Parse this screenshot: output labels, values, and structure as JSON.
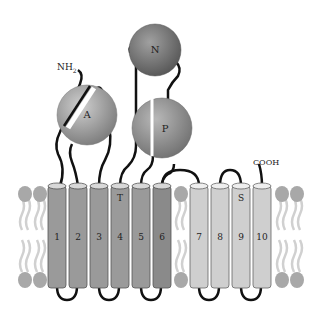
{
  "diagram": {
    "title": "",
    "termini": {
      "n_terminus": "NH",
      "n_terminus_sub": "2",
      "c_terminus": "COOH"
    },
    "domains": [
      {
        "id": "A",
        "label": "A"
      },
      {
        "id": "N",
        "label": "N"
      },
      {
        "id": "P",
        "label": "P"
      }
    ],
    "helices": [
      {
        "label": "1",
        "group": "dark"
      },
      {
        "label": "2",
        "group": "dark"
      },
      {
        "label": "3",
        "group": "dark"
      },
      {
        "label": "4",
        "group": "dark",
        "marker": "T"
      },
      {
        "label": "5",
        "group": "dark"
      },
      {
        "label": "6",
        "group": "dark"
      },
      {
        "label": "7",
        "group": "light"
      },
      {
        "label": "8",
        "group": "light"
      },
      {
        "label": "9",
        "group": "light",
        "marker": "S"
      },
      {
        "label": "10",
        "group": "light"
      }
    ],
    "colors": {
      "helix_dark": "#9a9a9a",
      "helix_light": "#cfcfcf",
      "lipid_head": "#a8a8a8",
      "lipid_tail": "#d0d0d0",
      "sphere": "#8e8e8e",
      "sphere_dark": "#6f6f6f",
      "linker": "#111111"
    }
  }
}
